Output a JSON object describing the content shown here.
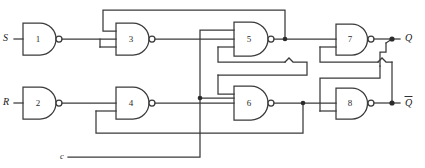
{
  "diagram": {
    "type": "logic-circuit",
    "gate_type": "NAND",
    "line_color": "#3a3a3a",
    "background_color": "#ffffff"
  },
  "inputs": [
    {
      "id": "S",
      "label": "S",
      "y": 39,
      "feeds_gate": "1"
    },
    {
      "id": "R",
      "label": "R",
      "y": 103,
      "feeds_gate": "2"
    },
    {
      "id": "C",
      "label": "c",
      "y": 157,
      "feeds_gate": "5,6"
    }
  ],
  "outputs": [
    {
      "id": "Q",
      "label": "Q",
      "overbar": false,
      "y": 39,
      "from_gate": "7"
    },
    {
      "id": "Qbar",
      "label": "Q",
      "overbar": true,
      "y": 103,
      "from_gate": "8"
    }
  ],
  "gates": [
    {
      "id": "g1",
      "number": "1",
      "kind": "NAND",
      "inputs": 2,
      "x": 34,
      "y": 39
    },
    {
      "id": "g2",
      "number": "2",
      "kind": "NAND",
      "inputs": 2,
      "x": 34,
      "y": 103
    },
    {
      "id": "g3",
      "number": "3",
      "kind": "NAND",
      "inputs": 2,
      "x": 127,
      "y": 39
    },
    {
      "id": "g4",
      "number": "4",
      "kind": "NAND",
      "inputs": 2,
      "x": 127,
      "y": 103
    },
    {
      "id": "g5",
      "number": "5",
      "kind": "NAND",
      "inputs": 3,
      "x": 245,
      "y": 39
    },
    {
      "id": "g6",
      "number": "6",
      "kind": "NAND",
      "inputs": 3,
      "x": 245,
      "y": 103
    },
    {
      "id": "g7",
      "number": "7",
      "kind": "NAND",
      "inputs": 2,
      "x": 347,
      "y": 39
    },
    {
      "id": "g8",
      "number": "8",
      "kind": "NAND",
      "inputs": 2,
      "x": 347,
      "y": 103
    }
  ],
  "junctions": [
    {
      "name": "g5-output-node",
      "x": 285,
      "y": 39
    },
    {
      "name": "g4-output-node",
      "x": 205,
      "y": 98
    },
    {
      "name": "g6-output-node",
      "x": 303,
      "y": 103
    },
    {
      "name": "q-output-node",
      "x": 392,
      "y": 39
    },
    {
      "name": "qbar-output-node",
      "x": 392,
      "y": 103
    }
  ]
}
